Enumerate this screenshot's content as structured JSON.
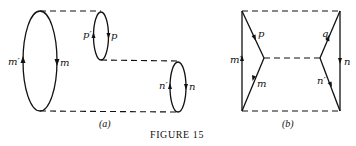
{
  "figure": {
    "caption": "Figure 15",
    "caption_display": "FIGURE 15",
    "panels": [
      {
        "id": "a",
        "label": "(a)",
        "description": "Three loops joined by dashed tube outlines",
        "loops": [
          {
            "name": "large-loop",
            "labels": {
              "left": "m′",
              "right": "m"
            }
          },
          {
            "name": "small-top-loop",
            "labels": {
              "left": "p′",
              "right": "p"
            }
          },
          {
            "name": "right-loop",
            "labels": {
              "left": "n′",
              "right": "n"
            }
          }
        ]
      },
      {
        "id": "b",
        "label": "(b)",
        "description": "Rectangle with two interior vertices joined by dashed line",
        "lines": {
          "left_vertical": "m′",
          "upper_left_diagonal": "p",
          "lower_left_diagonal": "m",
          "upper_right_diagonal": "q",
          "lower_right_diagonal": "n′",
          "right_vertical": "n"
        }
      }
    ]
  }
}
